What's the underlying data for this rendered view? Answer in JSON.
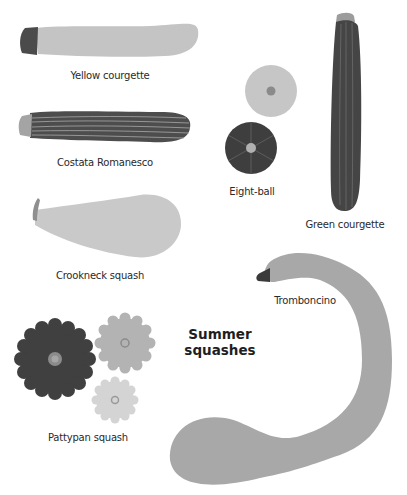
{
  "title": {
    "line1": "Summer",
    "line2": "squashes"
  },
  "colors": {
    "light": "#c4c4c4",
    "mid": "#a9a9a9",
    "dark": "#4b4b4b",
    "stem_dark": "#3c3c3c",
    "stem_light": "#9e9e9e",
    "stripe": "#bdbdbd",
    "pale": "#d3d3d3"
  },
  "squashes": [
    {
      "id": "yellow-courgette",
      "label": "Yellow courgette"
    },
    {
      "id": "costata-romanesco",
      "label": "Costata Romanesco"
    },
    {
      "id": "crookneck-squash",
      "label": "Crookneck squash"
    },
    {
      "id": "eight-ball",
      "label": "Eight-ball"
    },
    {
      "id": "green-courgette",
      "label": "Green courgette"
    },
    {
      "id": "tromboncino",
      "label": "Tromboncino"
    },
    {
      "id": "pattypan-squash",
      "label": "Pattypan squash"
    }
  ]
}
